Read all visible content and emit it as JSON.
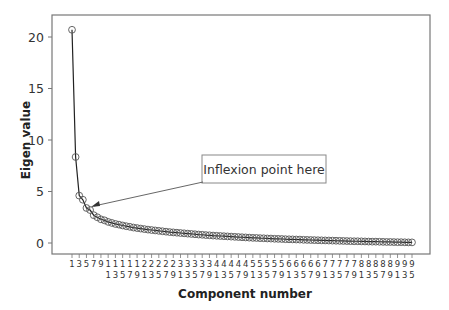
{
  "chart_data": {
    "type": "line",
    "title": "",
    "xlabel": "Component number",
    "ylabel": "Eigen value",
    "ylim": [
      -0.5,
      22
    ],
    "xlim": [
      0,
      97
    ],
    "yticks": [
      0,
      5,
      10,
      15,
      20
    ],
    "xtick_labels_top": [
      "1",
      "3",
      "5",
      "7",
      "9",
      "1",
      "1",
      "1",
      "1",
      "1",
      "2",
      "2",
      "2",
      "2",
      "2",
      "3",
      "3",
      "3",
      "3",
      "3",
      "4",
      "4",
      "4",
      "4",
      "4",
      "5",
      "5",
      "5",
      "5",
      "5",
      "6",
      "6",
      "6",
      "6",
      "6",
      "7",
      "7",
      "7",
      "7",
      "7",
      "8",
      "8",
      "8",
      "8",
      "8",
      "9",
      "9",
      "9"
    ],
    "xtick_labels_bottom": [
      "",
      "",
      "",
      "",
      "",
      "1",
      "3",
      "5",
      "7",
      "9",
      "1",
      "3",
      "5",
      "7",
      "9",
      "1",
      "3",
      "5",
      "7",
      "9",
      "1",
      "3",
      "5",
      "7",
      "9",
      "1",
      "3",
      "5",
      "7",
      "9",
      "1",
      "3",
      "5",
      "7",
      "9",
      "1",
      "3",
      "5",
      "7",
      "9",
      "1",
      "3",
      "5",
      "7",
      "9",
      "1",
      "3",
      "5"
    ],
    "xticks": [
      1,
      3,
      5,
      7,
      9,
      11,
      13,
      15,
      17,
      19,
      21,
      23,
      25,
      27,
      29,
      31,
      33,
      35,
      37,
      39,
      41,
      43,
      45,
      47,
      49,
      51,
      53,
      55,
      57,
      59,
      61,
      63,
      65,
      67,
      69,
      71,
      73,
      75,
      77,
      79,
      81,
      83,
      85,
      87,
      89,
      91,
      93,
      95
    ],
    "grid": false,
    "marker": "open-circle",
    "annotation": {
      "text": "Inflexion point here",
      "target_component": 5,
      "target_value": 3.4
    },
    "series": [
      {
        "name": "Eigen value",
        "x": [
          1,
          2,
          3,
          4,
          5,
          6,
          7,
          8,
          9,
          10,
          11,
          12,
          13,
          14,
          15,
          16,
          17,
          18,
          19,
          20,
          21,
          22,
          23,
          24,
          25,
          26,
          27,
          28,
          29,
          30,
          31,
          32,
          33,
          34,
          35,
          36,
          37,
          38,
          39,
          40,
          41,
          42,
          43,
          44,
          45,
          46,
          47,
          48,
          49,
          50,
          51,
          52,
          53,
          54,
          55,
          56,
          57,
          58,
          59,
          60,
          61,
          62,
          63,
          64,
          65,
          66,
          67,
          68,
          69,
          70,
          71,
          72,
          73,
          74,
          75,
          76,
          77,
          78,
          79,
          80,
          81,
          82,
          83,
          84,
          85,
          86,
          87,
          88,
          89,
          90,
          91,
          92,
          93,
          94,
          95
        ],
        "values": [
          20.7,
          8.35,
          4.6,
          4.2,
          3.4,
          3.2,
          2.7,
          2.5,
          2.3,
          2.2,
          2.05,
          1.95,
          1.85,
          1.78,
          1.7,
          1.63,
          1.57,
          1.5,
          1.45,
          1.4,
          1.35,
          1.3,
          1.26,
          1.22,
          1.18,
          1.14,
          1.1,
          1.06,
          1.03,
          1.0,
          0.97,
          0.94,
          0.91,
          0.88,
          0.85,
          0.82,
          0.8,
          0.77,
          0.75,
          0.72,
          0.7,
          0.68,
          0.66,
          0.64,
          0.62,
          0.6,
          0.58,
          0.56,
          0.54,
          0.52,
          0.5,
          0.49,
          0.47,
          0.46,
          0.44,
          0.43,
          0.41,
          0.4,
          0.39,
          0.37,
          0.36,
          0.35,
          0.34,
          0.33,
          0.31,
          0.3,
          0.29,
          0.28,
          0.27,
          0.26,
          0.25,
          0.24,
          0.23,
          0.22,
          0.21,
          0.2,
          0.19,
          0.18,
          0.17,
          0.17,
          0.16,
          0.15,
          0.14,
          0.13,
          0.13,
          0.12,
          0.11,
          0.1,
          0.1,
          0.09,
          0.08,
          0.08,
          0.07,
          0.06,
          0.06
        ]
      }
    ]
  },
  "colors": {
    "line": "#222222",
    "marker_stroke": "#555555",
    "axis": "#777777",
    "annotation_border": "#888888"
  }
}
